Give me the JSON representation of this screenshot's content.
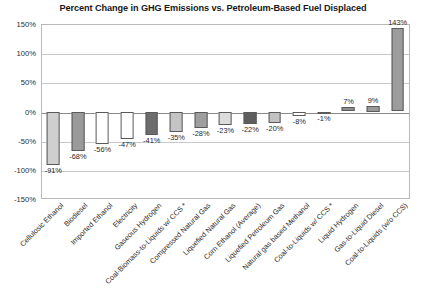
{
  "chart_data": {
    "type": "bar",
    "title": "Percent Change in GHG Emissions vs. Petroleum-Based Fuel Displaced",
    "xlabel": "",
    "ylabel": "",
    "ylim": [
      -150,
      150
    ],
    "ytick_values": [
      150,
      100,
      50,
      0,
      -50,
      -100,
      -150
    ],
    "ytick_labels": [
      "150%",
      "100%",
      "50%",
      "0%",
      "-50%",
      "-100%",
      "-150%"
    ],
    "grid": true,
    "legend": "none",
    "categories": [
      "Cellulosic Ethanol",
      "Biodiesel",
      "Imported Ethanol",
      "Electricity",
      "Gaseous Hydrogen",
      "Coal-Biomass-to-Liquids w/ CCS *",
      "Compressed Natural Gas",
      "Liquefied Natural Gas",
      "Corn Ethanol (Average)",
      "Liquefied Petroleum Gas",
      "Natural gas based Methanol",
      "Coal-to-Liquids w/ CCS *",
      "Liquid Hydrogen",
      "Gas-to-Liquid Diesel",
      "Coal-to-Liquids (w/o CCS)"
    ],
    "values": [
      -91,
      -68,
      -56,
      -47,
      -41,
      -35,
      -28,
      -23,
      -22,
      -20,
      -8,
      -1,
      7,
      9,
      143
    ],
    "data_labels": [
      "-91%",
      "-68%",
      "-56%",
      "-47%",
      "-41%",
      "-35%",
      "-28%",
      "-23%",
      "-22%",
      "-20%",
      "-8%",
      "-1%",
      "7%",
      "9%",
      "143%"
    ],
    "bar_colors": [
      "#cfcfcf",
      "#9a9a9a",
      "#ffffff",
      "#ffffff",
      "#6d6d6d",
      "#c4c4c4",
      "#9e9e9e",
      "#dcdcdc",
      "#5e5e5e",
      "#c2c2c2",
      "#ffffff",
      "#8f8f8f",
      "#8f8f8f",
      "#9a9a9a",
      "#9c9c9c"
    ],
    "bar_border_color": "#5a5a5a",
    "axis_color": "#b9b9b9",
    "gridline_color": "#c9c9c9",
    "zero_line_color": "#8a8a8a"
  }
}
